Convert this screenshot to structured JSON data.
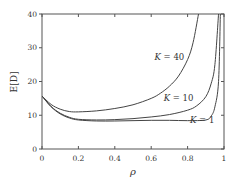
{
  "chart_data": {
    "type": "line",
    "title": "",
    "xlabel": "ρ",
    "ylabel": "E[D]",
    "xlim": [
      0,
      1
    ],
    "ylim": [
      0,
      40
    ],
    "xticks": [
      0,
      0.2,
      0.4,
      0.6,
      0.8,
      1
    ],
    "xtick_labels": [
      "0",
      "0.2",
      "0.4",
      "0.6",
      "0.8",
      "1"
    ],
    "yticks": [
      0,
      10,
      20,
      30,
      40
    ],
    "ytick_labels": [
      "0",
      "10",
      "20",
      "30",
      "40"
    ],
    "grid": false,
    "legend": "inline annotations",
    "series": [
      {
        "name": "K = 40",
        "label_pos": [
          0.7,
          26.5
        ],
        "x": [
          0,
          0.05,
          0.1,
          0.15,
          0.2,
          0.3,
          0.4,
          0.5,
          0.6,
          0.65,
          0.7,
          0.75,
          0.8,
          0.83,
          0.86
        ],
        "y": [
          15.7,
          13.2,
          11.8,
          11.1,
          11.0,
          11.3,
          12.0,
          13.1,
          15.0,
          16.5,
          18.6,
          21.6,
          26.5,
          31.5,
          40
        ]
      },
      {
        "name": "K = 10",
        "label_pos": [
          0.75,
          14.2
        ],
        "x": [
          0,
          0.05,
          0.1,
          0.15,
          0.2,
          0.3,
          0.4,
          0.5,
          0.6,
          0.7,
          0.8,
          0.85,
          0.9,
          0.93,
          0.95,
          0.97
        ],
        "y": [
          15.7,
          12.6,
          10.6,
          9.4,
          8.8,
          8.6,
          8.7,
          9.0,
          9.5,
          10.2,
          11.5,
          12.8,
          15.5,
          19.5,
          25.0,
          40
        ]
      },
      {
        "name": "K = 1",
        "label_pos": [
          0.88,
          7.6
        ],
        "x": [
          0,
          0.05,
          0.1,
          0.15,
          0.2,
          0.3,
          0.4,
          0.5,
          0.6,
          0.7,
          0.8,
          0.9,
          0.93,
          0.95,
          0.97,
          0.98
        ],
        "y": [
          15.7,
          12.5,
          10.4,
          9.2,
          8.6,
          8.3,
          8.3,
          8.4,
          8.5,
          8.5,
          8.4,
          8.6,
          9.8,
          12.5,
          20.0,
          40
        ]
      }
    ]
  }
}
